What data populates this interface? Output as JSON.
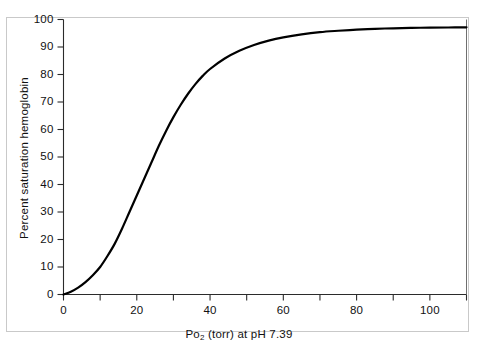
{
  "chart_data": {
    "type": "line",
    "title": "",
    "subtitle": "",
    "xlabel": "Po2 (torr) at pH 7.39",
    "xlabel_base": "Po",
    "xlabel_sub": "2",
    "xlabel_rest": " (torr) at pH 7.39",
    "ylabel": "Percent saturation hemoglobin",
    "xlim": [
      0,
      110
    ],
    "ylim": [
      0,
      100
    ],
    "grid": false,
    "legend": "none",
    "x_major_ticks": [
      0,
      10,
      20,
      30,
      40,
      50,
      60,
      70,
      80,
      90,
      100,
      110
    ],
    "x_tick_labels": [
      "0",
      "",
      "20",
      "",
      "40",
      "",
      "60",
      "",
      "80",
      "",
      "100",
      ""
    ],
    "y_major_ticks": [
      0,
      10,
      20,
      30,
      40,
      50,
      60,
      70,
      80,
      90,
      100
    ],
    "y_tick_labels": [
      "0",
      "10",
      "20",
      "30",
      "40",
      "50",
      "60",
      "70",
      "80",
      "90",
      "100"
    ],
    "series": [
      {
        "name": "Oxygen-hemoglobin dissociation curve",
        "color": "#000000",
        "x": [
          0,
          2,
          4,
          6,
          8,
          10,
          12,
          14,
          16,
          18,
          20,
          22,
          24,
          26,
          28,
          30,
          32,
          34,
          36,
          38,
          40,
          44,
          48,
          52,
          56,
          60,
          65,
          70,
          75,
          80,
          85,
          90,
          95,
          100,
          105,
          110
        ],
        "values": [
          0,
          1,
          2.5,
          4.5,
          7,
          10,
          14,
          18.5,
          24,
          30,
          36,
          42,
          48,
          54,
          59.5,
          64.5,
          69,
          73,
          76.5,
          79.5,
          82,
          85.8,
          88.6,
          90.7,
          92.3,
          93.5,
          94.6,
          95.4,
          95.9,
          96.3,
          96.6,
          96.8,
          96.95,
          97.05,
          97.1,
          97.15
        ]
      }
    ],
    "annotations": []
  },
  "axes": {
    "x_axis_name": "x-axis",
    "y_axis_name": "y-axis"
  }
}
